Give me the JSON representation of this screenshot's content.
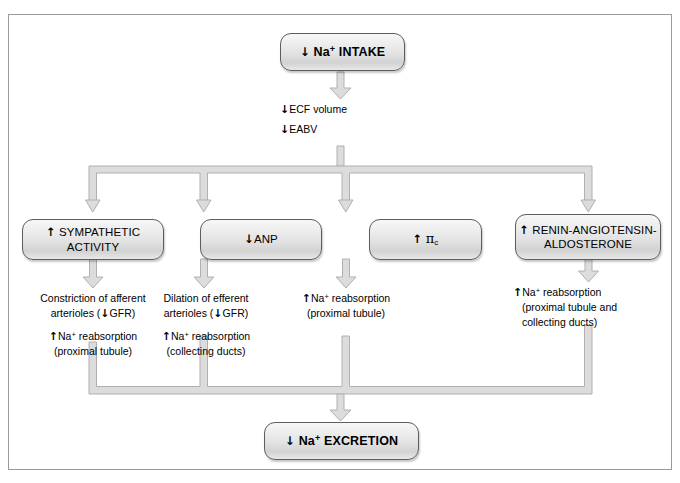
{
  "figure": {
    "frame_color": "#9a9a9a",
    "node_border_color": "#5d5d5d",
    "connector_color": "#b4b4b4",
    "text_color": "#000000"
  },
  "arrows": {
    "down": "↓",
    "up": "↑"
  },
  "nodes": {
    "intake": {
      "id": "na-intake",
      "text": "Na+ INTAKE",
      "arrow": "down",
      "label_plain": "↓ Na⁺ INTAKE"
    },
    "sympathetic": {
      "id": "sympathetic-activity",
      "line1": "SYMPATHETIC",
      "line2": "ACTIVITY",
      "arrow": "up",
      "label_plain": "↑ SYMPATHETIC ACTIVITY"
    },
    "anp": {
      "id": "anp",
      "text": "ANP",
      "arrow": "down",
      "label_plain": "↓ ANP"
    },
    "oncotic": {
      "id": "oncotic-pressure",
      "symbol": "π",
      "subscript": "c",
      "arrow": "up",
      "label_plain": "↑ πc"
    },
    "raas": {
      "id": "renin-angiotensin-aldosterone",
      "line1": "RENIN-ANGIOTENSIN-",
      "line2": "ALDOSTERONE",
      "arrow": "up",
      "label_plain": "↑ RENIN-ANGIOTENSIN-ALDOSTERONE"
    },
    "excretion": {
      "id": "na-excretion",
      "text": "Na+ EXCRETION",
      "arrow": "down",
      "label_plain": "↓ Na⁺ EXCRETION"
    }
  },
  "stem_text": {
    "line1_arrow": "down",
    "line1": "ECF volume",
    "line1_plain": "↓ ECF volume",
    "line2_arrow": "down",
    "line2": "EABV",
    "line2_plain": "↓ EABV"
  },
  "effects": {
    "sympathetic": {
      "top_line1_a": "Constriction of afferent",
      "top_line2_a": "arterioles (",
      "top_line2_arrow": "down",
      "top_line2_b": "GFR)",
      "bottom_arrow": "up",
      "bottom_line1": "Na+ reabsorption",
      "bottom_line2": "(proximal tubule)",
      "plain": "Constriction of afferent arterioles (↓GFR); ↑ Na⁺ reabsorption (proximal tubule)"
    },
    "anp": {
      "top_line1_a": "Dilation of efferent",
      "top_line2_a": "arterioles (",
      "top_line2_arrow": "down",
      "top_line2_b": "GFR)",
      "bottom_arrow": "up",
      "bottom_line1": "Na+ reabsorption",
      "bottom_line2": "(collecting ducts)",
      "plain": "Dilation of efferent arterioles (↓GFR); ↑ Na⁺ reabsorption (collecting ducts)"
    },
    "oncotic": {
      "bottom_arrow": "up",
      "bottom_line1": "Na+ reabsorption",
      "bottom_line2": "(proximal tubule)",
      "plain": "↑ Na⁺ reabsorption (proximal tubule)"
    },
    "raas": {
      "bottom_arrow": "up",
      "bottom_line1": "Na+ reabsorption",
      "bottom_line2": "(proximal tubule and",
      "bottom_line3": "collecting ducts)",
      "plain": "↑ Na⁺ reabsorption (proximal tubule and collecting ducts)"
    }
  }
}
